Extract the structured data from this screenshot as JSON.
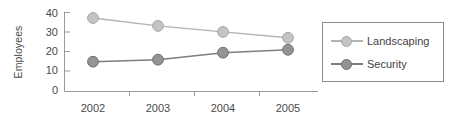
{
  "chart_data": {
    "type": "line",
    "title": "",
    "xlabel": "",
    "ylabel": "Employees",
    "categories": [
      "2002",
      "2003",
      "2004",
      "2005"
    ],
    "ylim": [
      0,
      40
    ],
    "yticks": [
      0,
      10,
      20,
      30,
      40
    ],
    "grid": false,
    "legend_position": "right",
    "series": [
      {
        "name": "Landscaping",
        "values": [
          37,
          33,
          30,
          27
        ],
        "color": "#bdbdbd",
        "line_color": "#b0b0b0",
        "marker": "circle"
      },
      {
        "name": "Security",
        "values": [
          15,
          16,
          19.5,
          21
        ],
        "color": "#8a8a8a",
        "line_color": "#7d7d7d",
        "marker": "circle"
      }
    ]
  },
  "axes": {
    "y_title": "Employees",
    "y_tick_labels": [
      "40",
      "30",
      "20",
      "10",
      "0"
    ],
    "x_tick_labels": [
      "2002",
      "2003",
      "2004",
      "2005"
    ],
    "axis_color": "#9a9a9a"
  },
  "legend": {
    "items": [
      {
        "label": "Landscaping"
      },
      {
        "label": "Security"
      }
    ],
    "border_color": "#8c8c8c"
  }
}
